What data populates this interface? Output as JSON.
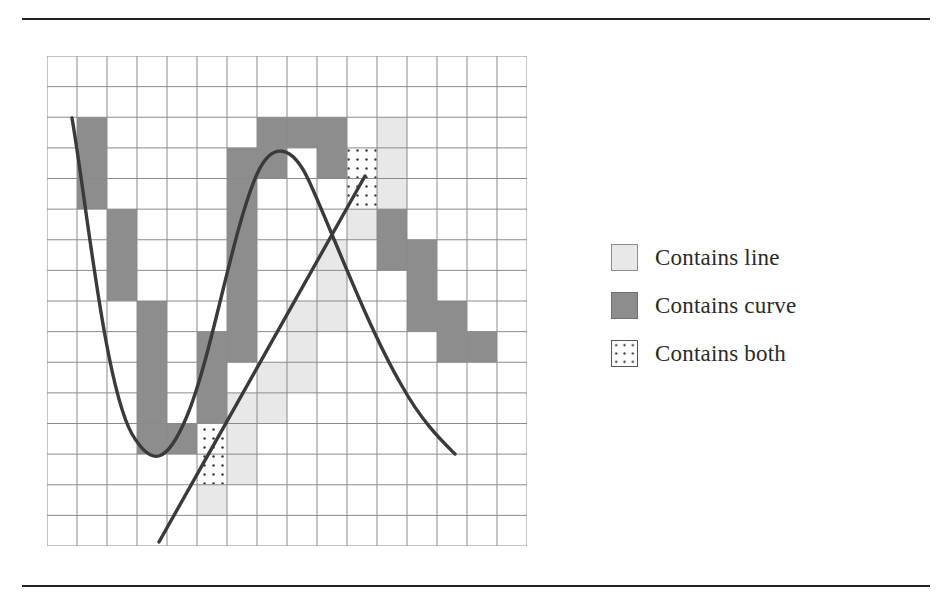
{
  "figure": {
    "title_rules": {
      "top_rule": "horizontal-rule",
      "bottom_rule": "horizontal-rule"
    }
  },
  "legend": {
    "items": [
      {
        "swatch": "light-gray-square",
        "label": "Contains line",
        "color": "#e8e8e8"
      },
      {
        "swatch": "dark-gray-square",
        "label": "Contains curve",
        "color": "#8d8d8d"
      },
      {
        "swatch": "dotted-square",
        "label": "Contains both",
        "color": "#fbfbfb"
      }
    ]
  },
  "chart_data": {
    "type": "heatmap",
    "title": "",
    "subtitle": "",
    "xlabel": "",
    "ylabel": "",
    "grid": true,
    "legend_position": "right",
    "grid_cols": 16,
    "grid_rows": 16,
    "cell_size": 30,
    "colors": {
      "line": "#e8e8e8",
      "curve": "#8d8d8d",
      "both": "#fbfbfb",
      "empty": "#ffffff",
      "gridline": "#8a8a8a",
      "stroke": "#3a3a3a"
    },
    "cells_curve": [
      [
        1,
        2
      ],
      [
        1,
        3
      ],
      [
        1,
        4
      ],
      [
        2,
        5
      ],
      [
        2,
        6
      ],
      [
        2,
        7
      ],
      [
        3,
        8
      ],
      [
        3,
        9
      ],
      [
        3,
        10
      ],
      [
        3,
        11
      ],
      [
        3,
        12
      ],
      [
        4,
        12
      ],
      [
        5,
        11
      ],
      [
        5,
        10
      ],
      [
        5,
        9
      ],
      [
        6,
        9
      ],
      [
        6,
        8
      ],
      [
        6,
        7
      ],
      [
        6,
        6
      ],
      [
        6,
        5
      ],
      [
        6,
        4
      ],
      [
        6,
        3
      ],
      [
        7,
        3
      ],
      [
        7,
        2
      ],
      [
        8,
        2
      ],
      [
        9,
        2
      ],
      [
        9,
        3
      ],
      [
        10,
        4
      ],
      [
        11,
        5
      ],
      [
        11,
        6
      ],
      [
        12,
        6
      ],
      [
        12,
        7
      ],
      [
        12,
        8
      ],
      [
        13,
        8
      ],
      [
        13,
        9
      ],
      [
        14,
        9
      ]
    ],
    "cells_line": [
      [
        5,
        14
      ],
      [
        5,
        13
      ],
      [
        6,
        13
      ],
      [
        6,
        12
      ],
      [
        6,
        11
      ],
      [
        7,
        11
      ],
      [
        7,
        10
      ],
      [
        8,
        10
      ],
      [
        8,
        9
      ],
      [
        8,
        8
      ],
      [
        9,
        8
      ],
      [
        9,
        7
      ],
      [
        9,
        6
      ],
      [
        10,
        5
      ],
      [
        11,
        4
      ],
      [
        11,
        3
      ],
      [
        11,
        2
      ]
    ],
    "cells_both": [
      [
        10,
        3
      ],
      [
        10,
        4
      ],
      [
        5,
        12
      ],
      [
        5,
        13
      ]
    ],
    "curve_path": "M 25,62 C 40,150 58,330 85,378 C 105,412 120,408 140,360 C 165,300 185,175 210,118 C 225,85 245,88 262,125 C 285,175 320,270 355,330 C 375,366 395,385 408,398",
    "line_path": "M 112,486 L 318,120",
    "annotations": []
  }
}
